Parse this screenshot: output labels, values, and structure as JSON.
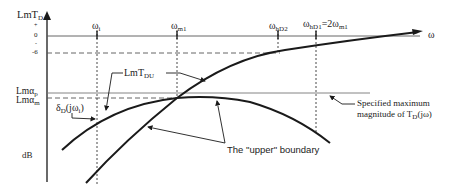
{
  "figure": {
    "y_axis_label": "LmT",
    "y_axis_label_sub": "D",
    "x_axis_label": "ω",
    "unit_label": "dB",
    "y_ticks": [
      {
        "label": "+",
        "y": 26
      },
      {
        "label": "0",
        "y": 36
      },
      {
        "label": "-",
        "y": 44
      },
      {
        "label": "-6",
        "y": 53
      }
    ],
    "level_labels": {
      "lm_alpha_p": "Lmα",
      "lm_alpha_p_sub": "p",
      "lm_alpha_m": "Lmα",
      "lm_alpha_m_sub": "m"
    },
    "frequency_markers": [
      {
        "label": "ω",
        "sub": "i",
        "x": 98
      },
      {
        "label": "ω",
        "sub": "m1",
        "x": 178
      },
      {
        "label": "ω",
        "sub": "hD2",
        "x": 278
      },
      {
        "label": "ω",
        "sub": "hD1",
        "x": 316,
        "suffix": "=2ω",
        "suffix_sub": "m1"
      }
    ],
    "curve_labels": {
      "lmt_du": "LmT",
      "lmt_du_sub": "DU",
      "delta": "δ",
      "delta_sub": "D",
      "delta_arg": "(jω",
      "delta_arg_sub": "i",
      "delta_close": ")"
    },
    "annotations": {
      "upper_boundary": "The \"upper\" boundary",
      "spec_line1": "Specified maximum",
      "spec_line2_pre": "magnitude of T",
      "spec_line2_sub": "D",
      "spec_line2_post": "(jω)"
    },
    "colors": {
      "line": "#1a1a1a",
      "grid": "#555555",
      "background": "#ffffff"
    }
  }
}
